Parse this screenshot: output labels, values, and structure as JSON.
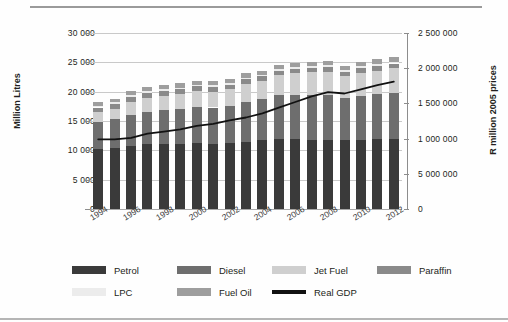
{
  "chart_data": {
    "type": "bar",
    "title": "",
    "subtitle": "",
    "xlabel": "",
    "ylabel": "Million Litres",
    "ylabel_right": "R million 2005 prices",
    "grid": true,
    "legend_position": "bottom",
    "ylim": [
      0,
      30000
    ],
    "ylim_right": [
      0,
      2500000
    ],
    "yticks": [
      "0",
      "5 000",
      "10 000",
      "15 000",
      "20 000",
      "25 000",
      "30 000"
    ],
    "ytick_values": [
      0,
      5000,
      10000,
      15000,
      20000,
      25000,
      30000
    ],
    "yticks_right": [
      "0",
      "5 000 000",
      "1 000 000",
      "1 500 000",
      "2 000 000",
      "2 500 000"
    ],
    "ytick_right_values": [
      0,
      500000,
      1000000,
      1500000,
      2000000,
      2500000
    ],
    "x": [
      1994,
      1995,
      1996,
      1997,
      1998,
      1999,
      2000,
      2001,
      2002,
      2003,
      2004,
      2005,
      2006,
      2007,
      2008,
      2009,
      2010,
      2011,
      2012
    ],
    "categories": [
      "1994",
      "1995",
      "1996",
      "1997",
      "1998",
      "1999",
      "2000",
      "2001",
      "2002",
      "2003",
      "2004",
      "2005",
      "2006",
      "2007",
      "2008",
      "2009",
      "2010",
      "2011",
      "2012"
    ],
    "xtick_labels": [
      "1994",
      "1996",
      "1998",
      "2000",
      "2002",
      "2004",
      "2006",
      "2008",
      "2010",
      "2012"
    ],
    "xtick_values": [
      1994,
      1996,
      1998,
      2000,
      2002,
      2004,
      2006,
      2008,
      2010,
      2012
    ],
    "stacked": true,
    "series": [
      {
        "name": "Petrol",
        "color": "#3a3a3a",
        "values": [
          10200,
          10400,
          10800,
          11000,
          11000,
          11100,
          11200,
          11100,
          11200,
          11500,
          11700,
          12000,
          11900,
          11800,
          11700,
          11700,
          11800,
          11900,
          11900
        ]
      },
      {
        "name": "Diesel",
        "color": "#6e6e6e",
        "values": [
          4600,
          4900,
          5300,
          5600,
          5800,
          5900,
          6200,
          6200,
          6400,
          6800,
          7000,
          7400,
          7600,
          7700,
          7800,
          7200,
          7500,
          7700,
          7900
        ]
      },
      {
        "name": "Jet Fuel",
        "color": "#cfcfcf",
        "values": [
          1700,
          1800,
          2200,
          2400,
          2500,
          2600,
          2700,
          2700,
          2800,
          3000,
          3100,
          3400,
          3600,
          3800,
          3900,
          3700,
          3900,
          4000,
          4200
        ]
      },
      {
        "name": "Paraffin",
        "color": "#8a8a8a",
        "values": [
          800,
          800,
          800,
          800,
          800,
          800,
          800,
          800,
          800,
          800,
          800,
          800,
          800,
          800,
          800,
          800,
          800,
          800,
          800
        ]
      },
      {
        "name": "LPC",
        "color": "#ececec",
        "values": [
          300,
          300,
          300,
          300,
          300,
          300,
          300,
          300,
          300,
          300,
          300,
          300,
          300,
          300,
          300,
          300,
          300,
          300,
          300
        ]
      },
      {
        "name": "Fuel Oil",
        "color": "#9e9e9e",
        "values": [
          600,
          600,
          700,
          700,
          700,
          700,
          700,
          700,
          700,
          700,
          700,
          700,
          700,
          700,
          800,
          700,
          700,
          800,
          800
        ]
      }
    ],
    "line_series": {
      "name": "Real GDP",
      "color": "#111111",
      "axis": "right",
      "values": [
        990000,
        990000,
        1010000,
        1070000,
        1100000,
        1130000,
        1180000,
        1210000,
        1260000,
        1300000,
        1360000,
        1440000,
        1520000,
        1600000,
        1660000,
        1640000,
        1700000,
        1760000,
        1810000
      ]
    },
    "legend": [
      {
        "label": "Petrol",
        "color": "#3a3a3a",
        "type": "swatch"
      },
      {
        "label": "Diesel",
        "color": "#6e6e6e",
        "type": "swatch"
      },
      {
        "label": "Jet Fuel",
        "color": "#cfcfcf",
        "type": "swatch"
      },
      {
        "label": "Paraffin",
        "color": "#8a8a8a",
        "type": "swatch"
      },
      {
        "label": "LPC",
        "color": "#ececec",
        "type": "swatch"
      },
      {
        "label": "Fuel Oil",
        "color": "#9e9e9e",
        "type": "swatch"
      },
      {
        "label": "Real GDP",
        "color": "#111111",
        "type": "line"
      }
    ]
  }
}
